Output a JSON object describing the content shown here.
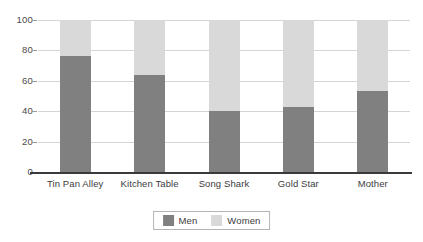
{
  "chart_data": {
    "type": "bar",
    "subtype": "stacked-bar-100-percent",
    "title": "",
    "subtitle": "",
    "xlabel": "",
    "ylabel": "",
    "ylim": [
      0,
      100
    ],
    "yticks": [
      0,
      20,
      40,
      60,
      80,
      100
    ],
    "ytick_labels": [
      "0",
      "20",
      "40",
      "60",
      "80",
      "100"
    ],
    "grid": true,
    "grid_axis": "y",
    "legend_position": "bottom-center",
    "categories": [
      "Tin Pan Alley",
      "Kitchen Table",
      "Song Shark",
      "Gold Star",
      "Mother"
    ],
    "series": [
      {
        "name": "Men",
        "color": "#808080",
        "values": [
          76,
          64,
          40,
          43,
          53
        ]
      },
      {
        "name": "Women",
        "color": "#d9d9d9",
        "values": [
          24,
          36,
          60,
          57,
          47
        ]
      }
    ],
    "annotations": []
  },
  "legend": {
    "entries": [
      {
        "label": "Men",
        "color": "#808080",
        "swatch_name": "legend-swatch-men"
      },
      {
        "label": "Women",
        "color": "#d9d9d9",
        "swatch_name": "legend-swatch-women"
      }
    ]
  },
  "colors": {
    "men": "#808080",
    "women": "#d9d9d9",
    "gridline": "#d5d5d5",
    "axis": "#3a3a3a",
    "text": "#3c3c3c",
    "background": "#ffffff"
  }
}
